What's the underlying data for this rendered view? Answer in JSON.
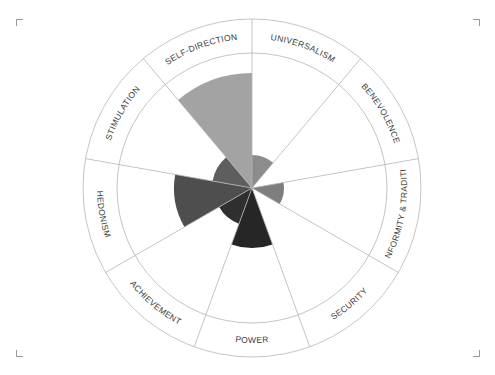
{
  "chart_data": {
    "type": "polar-area",
    "title": "",
    "center": [
      252,
      188
    ],
    "outer_radius": 169,
    "inner_radius": 135,
    "max_value": 135,
    "start_angle_deg": 0,
    "sector_span_deg": 40,
    "categories": [
      "UNIVERSALISM",
      "BENEVOLENCE",
      "CONFORMITY & TRADITION",
      "SECURITY",
      "POWER",
      "ACHIEVEMENT",
      "HEDONISM",
      "STIMULATION",
      "SELF-DIRECTION"
    ],
    "values": [
      33,
      0,
      32,
      0,
      60,
      38,
      78,
      40,
      115
    ],
    "colors": [
      "#8c8c8c",
      "#ffffff",
      "#7e7e7e",
      "#ffffff",
      "#262626",
      "#2f2f2f",
      "#4e4e4e",
      "#5e5e5e",
      "#a3a3a3"
    ],
    "label_direction": [
      "cw",
      "cw",
      "ccw",
      "ccw",
      "ccw",
      "ccw",
      "ccw",
      "cw",
      "cw"
    ],
    "grid": false,
    "legend": "none"
  },
  "frame": {
    "corner_color": "#9a9a9a",
    "ring_color": "#b5b5b5"
  }
}
